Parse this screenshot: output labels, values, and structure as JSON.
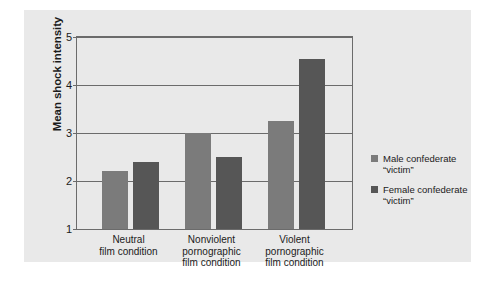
{
  "chart_data": {
    "type": "bar",
    "title": "",
    "subtitle": "",
    "xlabel": "",
    "ylabel": "Mean shock intensity",
    "ylim": [
      1,
      5
    ],
    "yticks": [
      1,
      2,
      3,
      4,
      5
    ],
    "ytick_labels": [
      "1",
      "2",
      "3",
      "4",
      "5"
    ],
    "grid": true,
    "legend_position": "right",
    "categories": [
      "Neutral\nfilm condition",
      "Nonviolent\npornographic\nfilm condition",
      "Violent\npornographic\nfilm condition"
    ],
    "series": [
      {
        "name": "Male confederate\n“victim”",
        "color": "#7b7b7b",
        "values": [
          2.2,
          3.0,
          3.25
        ]
      },
      {
        "name": "Female confederate\n“victim”",
        "color": "#565656",
        "values": [
          2.4,
          2.5,
          4.55
        ]
      }
    ]
  },
  "legend": {
    "entries": [
      {
        "line1": "Male confederate",
        "line2": "“victim”"
      },
      {
        "line1": "Female confederate",
        "line2": "“victim”"
      }
    ]
  },
  "axis": {
    "y_title": "Mean shock intensity",
    "tick_5": "5",
    "tick_4": "4",
    "tick_3": "3",
    "tick_2": "2",
    "tick_1": "1"
  },
  "x_axis": {
    "group_1": "Neutral\nfilm condition",
    "group_2": "Nonviolent\npornographic\nfilm condition",
    "group_3": "Violent\npornographic\nfilm condition"
  },
  "colors": {
    "male_bar": "#7b7b7b",
    "female_bar": "#565656",
    "panel_background": "#e9e9e9",
    "axis_line": "#6b6b6b"
  }
}
